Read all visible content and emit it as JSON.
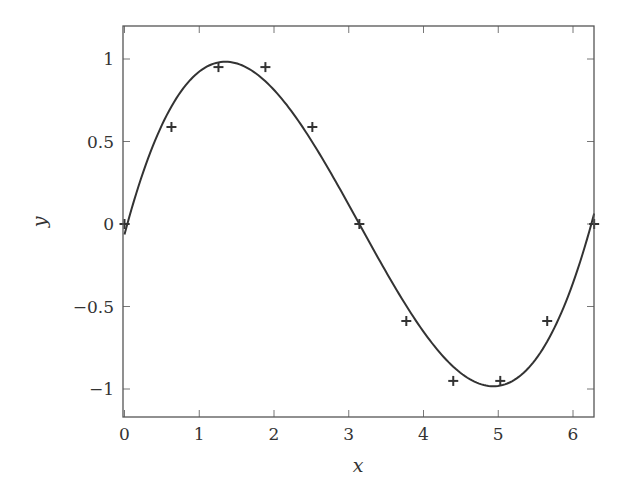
{
  "chart_data": {
    "type": "line",
    "title": "",
    "xlabel": "x",
    "ylabel": "y",
    "xlim": [
      0,
      6.2832
    ],
    "ylim": [
      -1.2,
      1.2
    ],
    "grid": false,
    "legend": null,
    "xticks": [
      0,
      1,
      2,
      3,
      4,
      5,
      6
    ],
    "xtick_labels": [
      "0",
      "1",
      "2",
      "3",
      "4",
      "5",
      "6"
    ],
    "yticks": [
      -1,
      -0.5,
      0,
      0.5,
      1
    ],
    "ytick_labels": [
      "−1",
      "−0.5",
      "0",
      "0.5",
      "1"
    ],
    "series": [
      {
        "name": "samples",
        "style": "markers",
        "marker": "+",
        "x": [
          0,
          0.628,
          1.257,
          1.885,
          2.513,
          3.142,
          3.77,
          4.398,
          5.027,
          5.655,
          6.283
        ],
        "y": [
          0,
          0.588,
          0.951,
          0.951,
          0.588,
          0,
          -0.588,
          -0.951,
          -0.951,
          -0.588,
          0
        ]
      },
      {
        "name": "cubic least-squares fit",
        "style": "line",
        "description": "degree-3 polynomial fit to the sample points",
        "x_range": [
          0,
          6.2832
        ]
      }
    ]
  },
  "colors": {
    "axis": "#555555",
    "curve": "#333333",
    "markers": "#333333",
    "text": "#333333",
    "background": "#ffffff"
  }
}
